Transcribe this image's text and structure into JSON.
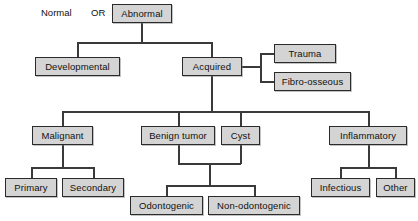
{
  "diagram": {
    "type": "flowchart",
    "colors": {
      "node_fill": "#d4d4d4",
      "node_border": "#2b2b2b",
      "edge": "#3a3a3a",
      "background": "#ffffff",
      "text": "#111111"
    },
    "labels": {
      "normal": "Normal",
      "or": "OR"
    },
    "nodes": [
      {
        "id": "abnormal",
        "label": "Abnormal"
      },
      {
        "id": "developmental",
        "label": "Developmental"
      },
      {
        "id": "acquired",
        "label": "Acquired"
      },
      {
        "id": "trauma",
        "label": "Trauma"
      },
      {
        "id": "fibro_osseous",
        "label": "Fibro-osseous"
      },
      {
        "id": "malignant",
        "label": "Malignant"
      },
      {
        "id": "benign_tumor",
        "label": "Benign tumor"
      },
      {
        "id": "cyst",
        "label": "Cyst"
      },
      {
        "id": "inflammatory",
        "label": "Inflammatory"
      },
      {
        "id": "primary",
        "label": "Primary"
      },
      {
        "id": "secondary",
        "label": "Secondary"
      },
      {
        "id": "odontogenic",
        "label": "Odontogenic"
      },
      {
        "id": "non_odontogenic",
        "label": "Non-odontogenic"
      },
      {
        "id": "infectious",
        "label": "Infectious"
      },
      {
        "id": "other",
        "label": "Other"
      }
    ],
    "edges": [
      {
        "from": "abnormal",
        "to": "developmental"
      },
      {
        "from": "abnormal",
        "to": "acquired"
      },
      {
        "from": "acquired",
        "to": "trauma"
      },
      {
        "from": "acquired",
        "to": "fibro_osseous"
      },
      {
        "from": "acquired",
        "to": "malignant"
      },
      {
        "from": "acquired",
        "to": "benign_tumor"
      },
      {
        "from": "acquired",
        "to": "cyst"
      },
      {
        "from": "acquired",
        "to": "inflammatory"
      },
      {
        "from": "malignant",
        "to": "primary"
      },
      {
        "from": "malignant",
        "to": "secondary"
      },
      {
        "from": "benign_tumor",
        "to": "odontogenic"
      },
      {
        "from": "benign_tumor",
        "to": "non_odontogenic"
      },
      {
        "from": "cyst",
        "to": "odontogenic"
      },
      {
        "from": "cyst",
        "to": "non_odontogenic"
      },
      {
        "from": "inflammatory",
        "to": "infectious"
      },
      {
        "from": "inflammatory",
        "to": "other"
      }
    ]
  }
}
